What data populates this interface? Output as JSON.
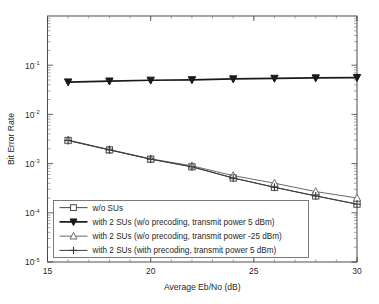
{
  "chart_data": {
    "type": "line",
    "title": "",
    "xlabel": "Average Eb/No (dB)",
    "ylabel": "Bit Error Rate",
    "xlim": [
      15,
      30
    ],
    "ylim": [
      1e-05,
      1
    ],
    "yscale": "log",
    "grid": false,
    "legend_position": "lower-left-inside",
    "xticks": [
      15,
      20,
      25,
      30
    ],
    "xticklabels": [
      "15",
      "20",
      "25",
      "30"
    ],
    "yticks": [
      0.1,
      0.01,
      0.001,
      0.0001,
      1e-05
    ],
    "yticklabels": [
      "10-1",
      "10-2",
      "10-3",
      "10-4",
      "10-5"
    ],
    "ytick_bases": [
      "10",
      "10",
      "10",
      "10",
      "10"
    ],
    "ytick_exponents": [
      "-1",
      "-2",
      "-3",
      "-4",
      "-5"
    ],
    "x": [
      16,
      18,
      20,
      22,
      24,
      26,
      28,
      30
    ],
    "series": [
      {
        "name": "w/o SUs",
        "marker": "square",
        "marker_filled": false,
        "color": "#4a4a4a",
        "linewidth": 1.0,
        "values": [
          0.00295,
          0.0019,
          0.00123,
          0.00086,
          0.00051,
          0.00033,
          0.00022,
          0.00015
        ]
      },
      {
        "name": "with 2 SUs (w/o precoding, transmit power 5 dBm)",
        "marker": "triangle-down",
        "marker_filled": true,
        "color": "#1a1a1a",
        "linewidth": 1.7,
        "values": [
          0.0455,
          0.0475,
          0.0495,
          0.0505,
          0.0525,
          0.054,
          0.055,
          0.056
        ]
      },
      {
        "name": "with 2 SUs (w/o precoding, transmit power -25 dBm)",
        "marker": "triangle-up",
        "marker_filled": false,
        "color": "#6a6a6a",
        "linewidth": 1.0,
        "values": [
          0.003,
          0.00193,
          0.00125,
          0.0009,
          0.00057,
          0.0004,
          0.00027,
          0.0002
        ]
      },
      {
        "name": "with 2 SUs (with precoding, transmit power 5 dBm)",
        "marker": "plus",
        "marker_filled": false,
        "color": "#3a3a3a",
        "linewidth": 1.0,
        "values": [
          0.00295,
          0.0019,
          0.00123,
          0.00086,
          0.00051,
          0.00033,
          0.00022,
          0.00015
        ]
      }
    ]
  },
  "legend": {
    "entries": [
      "w/o SUs",
      "with 2 SUs (w/o precoding, transmit power 5 dBm)",
      "with 2 SUs (w/o precoding, transmit power -25 dBm)",
      "with 2 SUs (with precoding, transmit power 5 dBm)"
    ]
  },
  "colors": {
    "axis": "#3a3a3a",
    "background": "#ffffff",
    "text": "#1f1f1f"
  }
}
